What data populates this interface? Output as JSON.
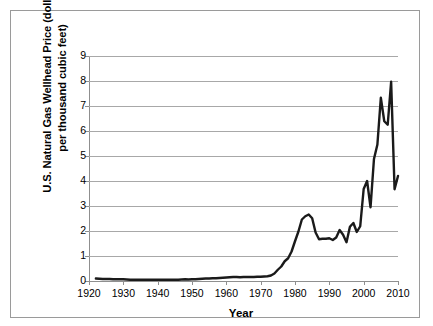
{
  "figure": {
    "background_color": "#ffffff",
    "frame_color": "#9a9a9a"
  },
  "axis": {
    "y_label_line1": "U.S. Natural Gas Wellhead Price (dollars",
    "y_label_line2": "per thousand cubic feet)",
    "x_label": "Year",
    "y_ticks": [
      "0",
      "1",
      "2",
      "3",
      "4",
      "5",
      "6",
      "7",
      "8",
      "9"
    ],
    "x_ticks": [
      "1920",
      "1930",
      "1940",
      "1950",
      "1960",
      "1970",
      "1980",
      "1990",
      "2000",
      "2010"
    ]
  },
  "chart_data": {
    "type": "line",
    "title": "",
    "xlabel": "Year",
    "ylabel": "U.S. Natural Gas Wellhead Price (dollars per thousand cubic feet)",
    "xlim": [
      1920,
      2010
    ],
    "ylim": [
      0,
      9
    ],
    "grid": true,
    "legend": "none",
    "line_color": "#1a1a1a",
    "line_width": 2.4,
    "x": [
      1922,
      1923,
      1924,
      1925,
      1926,
      1927,
      1928,
      1929,
      1930,
      1931,
      1932,
      1933,
      1934,
      1935,
      1936,
      1937,
      1938,
      1939,
      1940,
      1941,
      1942,
      1943,
      1944,
      1945,
      1946,
      1947,
      1948,
      1949,
      1950,
      1951,
      1952,
      1953,
      1954,
      1955,
      1956,
      1957,
      1958,
      1959,
      1960,
      1961,
      1962,
      1963,
      1964,
      1965,
      1966,
      1967,
      1968,
      1969,
      1970,
      1971,
      1972,
      1973,
      1974,
      1975,
      1976,
      1977,
      1978,
      1979,
      1980,
      1981,
      1982,
      1983,
      1984,
      1985,
      1986,
      1987,
      1988,
      1989,
      1990,
      1991,
      1992,
      1993,
      1994,
      1995,
      1996,
      1997,
      1998,
      1999,
      2000,
      2001,
      2002,
      2003,
      2004,
      2005,
      2006,
      2007,
      2008,
      2009,
      2010
    ],
    "y": [
      0.1,
      0.09,
      0.08,
      0.08,
      0.08,
      0.07,
      0.07,
      0.07,
      0.07,
      0.06,
      0.05,
      0.05,
      0.05,
      0.05,
      0.05,
      0.05,
      0.05,
      0.05,
      0.05,
      0.05,
      0.05,
      0.05,
      0.05,
      0.05,
      0.05,
      0.06,
      0.07,
      0.06,
      0.07,
      0.07,
      0.08,
      0.09,
      0.1,
      0.1,
      0.11,
      0.11,
      0.12,
      0.13,
      0.14,
      0.15,
      0.16,
      0.16,
      0.15,
      0.16,
      0.16,
      0.16,
      0.16,
      0.17,
      0.17,
      0.18,
      0.19,
      0.22,
      0.3,
      0.45,
      0.58,
      0.79,
      0.91,
      1.18,
      1.59,
      1.98,
      2.46,
      2.59,
      2.66,
      2.51,
      1.94,
      1.67,
      1.69,
      1.69,
      1.71,
      1.64,
      1.74,
      2.04,
      1.85,
      1.55,
      2.17,
      2.32,
      1.96,
      2.19,
      3.68,
      4.0,
      2.95,
      4.88,
      5.46,
      7.33,
      6.39,
      6.25,
      7.97,
      3.67,
      4.2
    ],
    "annotations": []
  }
}
